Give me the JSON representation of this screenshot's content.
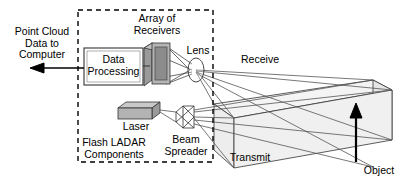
{
  "figure": {
    "background_color": "#ffffff",
    "line_color": "#000000",
    "ray_color": "#555555",
    "component_fill": "#b0b0b0",
    "component_fill_light": "#d0d0d0",
    "object_fill": "#f2f2f2"
  },
  "labels": {
    "point_cloud_output": "Point Cloud\nData to\nComputer",
    "data_processing": "Data\nProcessing",
    "array_of_receivers": "Array of\nReceivers",
    "lens": "Lens",
    "laser": "Laser",
    "beam_spreader": "Beam\nSpreader",
    "flash_ladar_components": "Flash LADAR\nComponents",
    "receive": "Receive",
    "transmit": "Transmit",
    "object": "Object"
  },
  "enclosure": {
    "name": "Flash LADAR Components",
    "style": "dashed",
    "x": 78,
    "y": 10,
    "width": 135,
    "height": 152
  },
  "components": [
    {
      "id": "data-processing",
      "label": "Data\nProcessing",
      "shape": "rectangle",
      "x": 84,
      "y": 48,
      "width": 59,
      "height": 37
    },
    {
      "id": "array-of-receivers",
      "label": "Array of\nReceivers",
      "shape": "3d-panel",
      "x": 144,
      "y": 44,
      "width": 26,
      "height": 40
    },
    {
      "id": "lens",
      "label": "Lens",
      "shape": "ellipse",
      "cx": 196,
      "cy": 70,
      "rx": 8,
      "ry": 12
    },
    {
      "id": "laser",
      "label": "Laser",
      "shape": "3d-box",
      "x": 118,
      "y": 103,
      "width": 36,
      "height": 15
    },
    {
      "id": "beam-spreader",
      "label": "Beam\nSpreader",
      "shape": "polygon",
      "x": 176,
      "y": 106,
      "width": 18,
      "height": 22
    },
    {
      "id": "object",
      "label": "Object",
      "shape": "3d-box",
      "x": 340,
      "y": 80,
      "width": 52,
      "height": 86
    }
  ],
  "beams": [
    {
      "id": "transmit-cone",
      "label": "Transmit",
      "from": "beam-spreader",
      "to": "object"
    },
    {
      "id": "receive-cone",
      "label": "Receive",
      "from": "object",
      "to": "lens"
    }
  ],
  "arrows": [
    {
      "id": "output-arrow",
      "label": "Point Cloud Data to Computer",
      "direction": "left",
      "from_x": 84,
      "to_x": 34,
      "y": 68
    },
    {
      "id": "object-pointer-arrow",
      "label": "Object",
      "direction": "up",
      "x": 356,
      "from_y": 160,
      "to_y": 110
    }
  ]
}
